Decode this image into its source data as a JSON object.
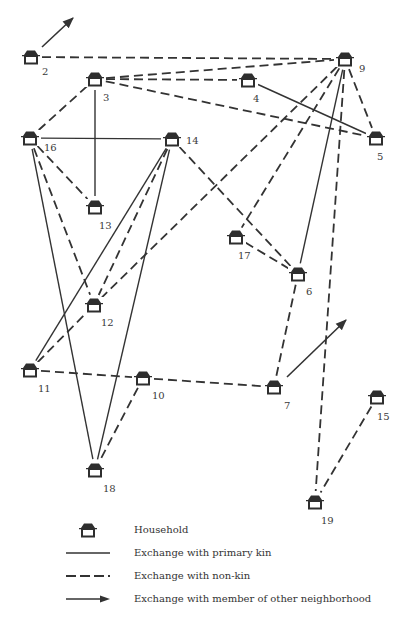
{
  "diagram": {
    "type": "social-network",
    "line_color": "#333333",
    "nodes": [
      {
        "id": "2",
        "label": "2",
        "x": 31,
        "y": 57
      },
      {
        "id": "3",
        "label": "3",
        "x": 95,
        "y": 79
      },
      {
        "id": "4",
        "label": "4",
        "x": 248,
        "y": 80
      },
      {
        "id": "5",
        "label": "5",
        "x": 376,
        "y": 138
      },
      {
        "id": "9",
        "label": "9",
        "x": 345,
        "y": 59
      },
      {
        "id": "16",
        "label": "16",
        "x": 30,
        "y": 138
      },
      {
        "id": "14",
        "label": "14",
        "x": 172,
        "y": 139
      },
      {
        "id": "13",
        "label": "13",
        "x": 95,
        "y": 207
      },
      {
        "id": "17",
        "label": "17",
        "x": 236,
        "y": 237
      },
      {
        "id": "6",
        "label": "6",
        "x": 298,
        "y": 274
      },
      {
        "id": "12",
        "label": "12",
        "x": 94,
        "y": 305
      },
      {
        "id": "11",
        "label": "11",
        "x": 30,
        "y": 370
      },
      {
        "id": "10",
        "label": "10",
        "x": 143,
        "y": 378
      },
      {
        "id": "7",
        "label": "7",
        "x": 274,
        "y": 387
      },
      {
        "id": "15",
        "label": "15",
        "x": 377,
        "y": 397
      },
      {
        "id": "18",
        "label": "18",
        "x": 95,
        "y": 470
      },
      {
        "id": "19",
        "label": "19",
        "x": 315,
        "y": 502
      }
    ],
    "edges": [
      {
        "from": "2",
        "to": "9",
        "type": "non-kin"
      },
      {
        "from": "3",
        "to": "9",
        "type": "non-kin"
      },
      {
        "from": "3",
        "to": "4",
        "type": "non-kin"
      },
      {
        "from": "3",
        "to": "5",
        "type": "non-kin"
      },
      {
        "from": "3",
        "to": "16",
        "type": "non-kin"
      },
      {
        "from": "3",
        "to": "13",
        "type": "primary-kin"
      },
      {
        "from": "4",
        "to": "5",
        "type": "primary-kin"
      },
      {
        "from": "9",
        "to": "5",
        "type": "non-kin"
      },
      {
        "from": "9",
        "to": "12",
        "type": "non-kin"
      },
      {
        "from": "9",
        "to": "17",
        "type": "non-kin"
      },
      {
        "from": "9",
        "to": "6",
        "type": "primary-kin"
      },
      {
        "from": "9",
        "to": "19",
        "type": "non-kin"
      },
      {
        "from": "16",
        "to": "14",
        "type": "primary-kin"
      },
      {
        "from": "16",
        "to": "13",
        "type": "non-kin"
      },
      {
        "from": "16",
        "to": "12",
        "type": "non-kin"
      },
      {
        "from": "16",
        "to": "18",
        "type": "primary-kin"
      },
      {
        "from": "14",
        "to": "11",
        "type": "primary-kin"
      },
      {
        "from": "14",
        "to": "12",
        "type": "non-kin"
      },
      {
        "from": "14",
        "to": "18",
        "type": "primary-kin"
      },
      {
        "from": "14",
        "to": "6",
        "type": "non-kin"
      },
      {
        "from": "17",
        "to": "6",
        "type": "non-kin"
      },
      {
        "from": "6",
        "to": "7",
        "type": "non-kin"
      },
      {
        "from": "11",
        "to": "12",
        "type": "non-kin"
      },
      {
        "from": "11",
        "to": "10",
        "type": "non-kin"
      },
      {
        "from": "10",
        "to": "7",
        "type": "non-kin"
      },
      {
        "from": "10",
        "to": "18",
        "type": "non-kin"
      },
      {
        "from": "15",
        "to": "19",
        "type": "non-kin"
      }
    ],
    "external_arrows": [
      {
        "from": "2",
        "x1": 42,
        "y1": 47,
        "x2": 73,
        "y2": 18
      },
      {
        "from": "7",
        "x1": 287,
        "y1": 377,
        "x2": 346,
        "y2": 320
      }
    ]
  },
  "legend": {
    "items": [
      {
        "symbol": "house-icon",
        "label": "Household"
      },
      {
        "symbol": "solid-line",
        "label": "Exchange with primary kin"
      },
      {
        "symbol": "dashed-line",
        "label": "Exchange with non-kin"
      },
      {
        "symbol": "arrow-line",
        "label": "Exchange with member of other neighborhood"
      }
    ]
  }
}
